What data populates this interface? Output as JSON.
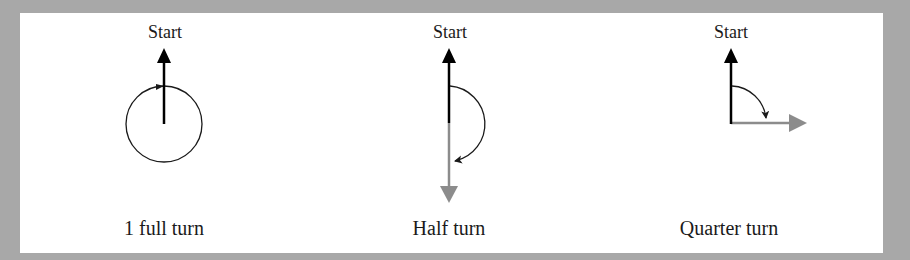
{
  "colors": {
    "background": "#a8a8a8",
    "panel": "#ffffff",
    "start_arrow": "#000000",
    "end_arrow": "#8c8c8c",
    "turn_arc": "#1a1a1a"
  },
  "diagrams": [
    {
      "id": "full-turn",
      "start_label": "Start",
      "caption": "1 full turn",
      "turn_degrees": 360
    },
    {
      "id": "half-turn",
      "start_label": "Start",
      "caption": "Half turn",
      "turn_degrees": 180
    },
    {
      "id": "quarter-turn",
      "start_label": "Start",
      "caption": "Quarter turn",
      "turn_degrees": 90
    }
  ]
}
